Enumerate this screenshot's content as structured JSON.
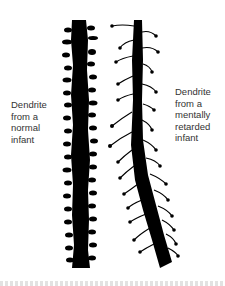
{
  "figure": {
    "labels": {
      "left": [
        "Dendrite",
        "from a",
        "normal",
        "infant"
      ],
      "right": [
        "Dendrite",
        "from a",
        "mentally",
        "retarded",
        "infant"
      ]
    },
    "colors": {
      "dendrite": "#000000",
      "text": "#333333",
      "background": "#ffffff"
    },
    "panels": [
      {
        "name": "normal-dendrite",
        "description": "thick dendrite with many short stubby spines"
      },
      {
        "name": "retarded-dendrite",
        "description": "dendrite with long thin spines ending in small knobs"
      }
    ]
  }
}
